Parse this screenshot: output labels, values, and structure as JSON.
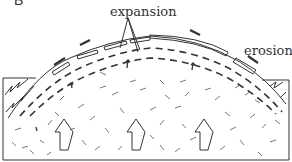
{
  "figure": {
    "panel_label": "B",
    "labels": {
      "expansion": "expansion",
      "erosion": "erosion"
    },
    "colors": {
      "ink": "#333333",
      "background": "#ffffff"
    },
    "elements": {
      "dome": "granite dome with exfoliation sheets",
      "large_arrows": 3,
      "description": "Exfoliation dome: upward expansion of granite as overlying rock is eroded, sheets peel off"
    }
  }
}
